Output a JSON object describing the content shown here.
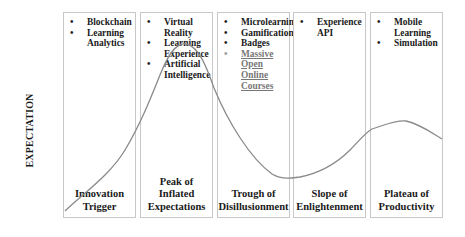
{
  "y_axis_label": "EXPECTATION",
  "phases": [
    {
      "name": "Innovation Trigger",
      "label_lines": [
        "Innovation",
        "Trigger"
      ],
      "items": [
        {
          "text": "Blockchain",
          "link": false
        },
        {
          "text": "Learning Analytics",
          "link": false
        }
      ]
    },
    {
      "name": "Peak of Inflated Expectations",
      "label_lines": [
        "Peak of",
        "Inflated",
        "Expectations"
      ],
      "items": [
        {
          "text": "Virtual Reality",
          "link": false
        },
        {
          "text": "Learning Experience",
          "link": false
        },
        {
          "text": "Artificial Intelligence",
          "link": false
        }
      ]
    },
    {
      "name": "Trough of Disillusionment",
      "label_lines": [
        "Trough of",
        "Disillusionment"
      ],
      "items": [
        {
          "text": "Microlearning",
          "link": false
        },
        {
          "text": "Gamification",
          "link": false
        },
        {
          "text": "Badges",
          "link": false
        },
        {
          "text": "Massive Open Online Courses",
          "link": true
        }
      ]
    },
    {
      "name": "Slope of Enlightenment",
      "label_lines": [
        "Slope of",
        "Enlightenment"
      ],
      "items": [
        {
          "text": "Experience API",
          "link": false
        }
      ]
    },
    {
      "name": "Plateau of Productivity",
      "label_lines": [
        "Plateau of",
        "Productivity"
      ],
      "items": [
        {
          "text": "Mobile Learning",
          "link": false
        },
        {
          "text": "Simulation",
          "link": false
        }
      ]
    }
  ],
  "colors": {
    "curve": "#8a8a8a",
    "box_border": "#c8c8c8",
    "text": "#1a1a1a",
    "link_text": "#777777"
  }
}
